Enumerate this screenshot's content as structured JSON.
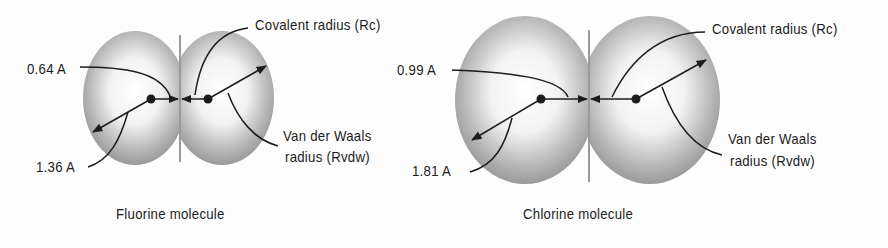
{
  "figure": {
    "molecules": [
      {
        "name": "Fluorine molecule",
        "covalent_radius": "0.64 A",
        "van_der_waals_radius": "1.36 A",
        "covalent_label": "Covalent radius (Rc)",
        "vdw_label_line1": "Van der Waals",
        "vdw_label_line2": "radius (Rvdw)"
      },
      {
        "name": "Chlorine molecule",
        "covalent_radius": "0.99 A",
        "van_der_waals_radius": "1.81 A",
        "covalent_label": "Covalent radius (Rc)",
        "vdw_label_line1": "Van der Waals",
        "vdw_label_line2": "radius (Rvdw)"
      }
    ],
    "colors": {
      "ink": "#1c1c1c",
      "shade": "#8a8a8a",
      "background": "#fdfdfd"
    }
  }
}
